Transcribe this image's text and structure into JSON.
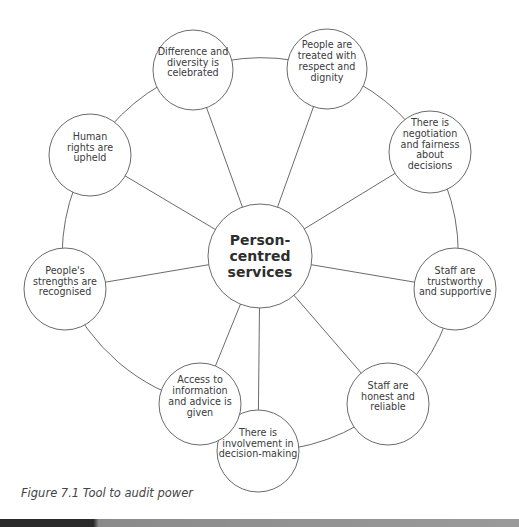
{
  "diagram": {
    "center": {
      "lines": [
        "Person-",
        "centred",
        "services"
      ],
      "x": 260,
      "y": 256,
      "r": 52
    },
    "nodes": [
      {
        "id": "difference",
        "lines": [
          "Difference and",
          "diversity is",
          "celebrated"
        ],
        "x": 193,
        "y": 70,
        "r": 40
      },
      {
        "id": "respect",
        "lines": [
          "People are",
          "treated with",
          "respect and",
          "dignity"
        ],
        "x": 327,
        "y": 69,
        "r": 40
      },
      {
        "id": "negotiation",
        "lines": [
          "There is",
          "negotiation",
          "and fairness",
          "about",
          "decisions"
        ],
        "x": 430,
        "y": 152,
        "r": 41
      },
      {
        "id": "trustworthy",
        "lines": [
          "Staff are",
          "trustworthy",
          "and supportive"
        ],
        "x": 455,
        "y": 289,
        "r": 41
      },
      {
        "id": "honest",
        "lines": [
          "Staff are",
          "honest and",
          "reliable"
        ],
        "x": 388,
        "y": 404,
        "r": 41
      },
      {
        "id": "involvement",
        "lines": [
          "There is",
          "involvement in",
          "decision-making"
        ],
        "x": 258,
        "y": 451,
        "r": 41
      },
      {
        "id": "access",
        "lines": [
          "Access to",
          "information",
          "and advice is",
          "given"
        ],
        "x": 200,
        "y": 404,
        "r": 41
      },
      {
        "id": "strengths",
        "lines": [
          "People's",
          "strengths are",
          "recognised"
        ],
        "x": 65,
        "y": 289,
        "r": 41
      },
      {
        "id": "human-rights",
        "lines": [
          "Human",
          "rights are",
          "upheld"
        ],
        "x": 90,
        "y": 155,
        "r": 41
      }
    ],
    "stroke_color": "#6b6b6b",
    "text_color": "#3a3a3a"
  },
  "caption": "Figure 7.1 Tool to audit power"
}
